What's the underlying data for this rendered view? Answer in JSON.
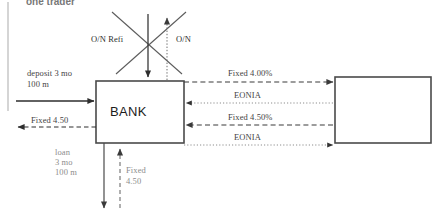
{
  "page": {
    "width": 438,
    "height": 223,
    "background": "#ffffff",
    "cropped_heading": "one trader"
  },
  "entities": {
    "bank_box_label": "BANK",
    "counterparty_box_label": ""
  },
  "labels": {
    "on_refi": "O/N Refi",
    "on": "O/N",
    "deposit_line1": "deposit 3 mo",
    "deposit_line2": "100 m",
    "fixed_450_left": "Fixed 4.50",
    "loan_line1": "loan",
    "loan_line2": "3 mo",
    "loan_line3": "100 m",
    "fixed_bottom_line1": "Fixed",
    "fixed_bottom_line2": "4.50",
    "fixed_400_pct": "Fixed 4.00%",
    "eonia_top": "EONIA",
    "fixed_450_pct": "Fixed 4.50%",
    "eonia_bottom": "EONIA"
  },
  "colors": {
    "stroke_dark": "#3a3a3a",
    "stroke_mid": "#5c5c5c",
    "stroke_light": "#9a9a9a",
    "box_border": "#4a4a4a",
    "text": "#444444"
  },
  "flows": [
    {
      "name": "deposit-in",
      "direction": "into-bank",
      "style": "solid",
      "label": "deposit 3 mo / 100 m"
    },
    {
      "name": "fixed-450-out",
      "direction": "out-of-bank-left",
      "style": "dashed",
      "label": "Fixed 4.50"
    },
    {
      "name": "loan-out-bottom",
      "direction": "out-of-bank-down",
      "style": "solid",
      "label": "loan 3 mo 100 m"
    },
    {
      "name": "fixed-450-in-bottom",
      "direction": "into-bank-up",
      "style": "dashed",
      "label": "Fixed 4.50"
    },
    {
      "name": "on-refi-in-top",
      "direction": "into-bank-down",
      "style": "solid",
      "label": "O/N Refi"
    },
    {
      "name": "on-out-top",
      "direction": "out-of-bank-up",
      "style": "dotted",
      "label": "O/N"
    },
    {
      "name": "fixed-400-out-right",
      "direction": "bank-to-counterparty",
      "style": "dashed",
      "label": "Fixed 4.00%"
    },
    {
      "name": "eonia-in-top-right",
      "direction": "counterparty-to-bank",
      "style": "dotted",
      "label": "EONIA"
    },
    {
      "name": "fixed-450-in-right",
      "direction": "counterparty-to-bank",
      "style": "dashed",
      "label": "Fixed 4.50%"
    },
    {
      "name": "eonia-out-bottom-right",
      "direction": "bank-to-counterparty",
      "style": "dotted",
      "label": "EONIA"
    }
  ]
}
